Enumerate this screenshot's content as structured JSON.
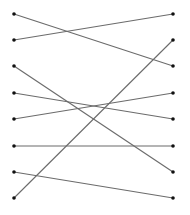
{
  "diagram": {
    "type": "bipartite-matching",
    "colors": {
      "line": "#6b6b6b",
      "dot": "#111111",
      "background": "#ffffff"
    },
    "left_x": 14,
    "right_x": 173,
    "rows_y": [
      14,
      40,
      66,
      93,
      119,
      146,
      172,
      198
    ],
    "left_nodes": [
      0,
      1,
      2,
      3,
      4,
      5,
      6,
      7
    ],
    "right_nodes": [
      0,
      1,
      2,
      3,
      4,
      5,
      6,
      7
    ],
    "edges": [
      {
        "from": 0,
        "to": 2
      },
      {
        "from": 1,
        "to": 0
      },
      {
        "from": 2,
        "to": 6
      },
      {
        "from": 3,
        "to": 4
      },
      {
        "from": 4,
        "to": 3
      },
      {
        "from": 5,
        "to": 5
      },
      {
        "from": 6,
        "to": 7
      },
      {
        "from": 7,
        "to": 1
      }
    ]
  }
}
